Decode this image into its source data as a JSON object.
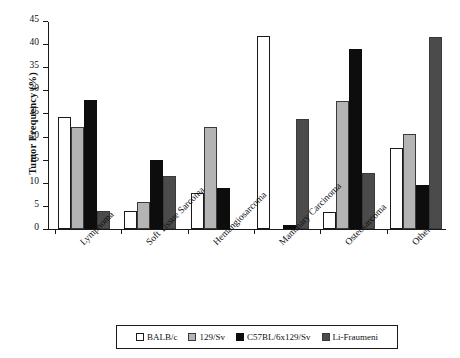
{
  "chart_data": {
    "type": "bar",
    "title": "",
    "xlabel": "",
    "ylabel": "Tumor Frequency (%)",
    "ylim": [
      0,
      45
    ],
    "yticks": [
      0,
      5,
      10,
      15,
      20,
      25,
      30,
      35,
      40,
      45
    ],
    "grid": false,
    "legend_position": "bottom",
    "categories": [
      "Lymphoma",
      "Soft Tissue Sarcoma",
      "Hemangiosarcoma",
      "Mammary Carcinoma",
      "Osteosarcoma",
      "Other"
    ],
    "series": [
      {
        "name": "BALB/c",
        "color": "#ffffff",
        "values": [
          24.3,
          3.8,
          7.8,
          41.8,
          3.6,
          17.5
        ]
      },
      {
        "name": "129/Sv",
        "color": "#b4b4b4",
        "values": [
          22.1,
          5.9,
          22.0,
          0,
          27.8,
          20.6
        ]
      },
      {
        "name": "C57BL/6x129/Sv",
        "color": "#0d0d0d",
        "values": [
          28.0,
          15.0,
          8.8,
          0.9,
          39.0,
          9.6
        ]
      },
      {
        "name": "Li-Fraumeni",
        "color": "#4b4b4b",
        "values": [
          4.0,
          11.4,
          0,
          23.9,
          12.2,
          41.6
        ]
      }
    ]
  },
  "legend": {
    "items": [
      {
        "label": "BALB/c"
      },
      {
        "label": "129/Sv"
      },
      {
        "label": "C57BL/6x129/Sv"
      },
      {
        "label": "Li-Fraumeni"
      }
    ]
  }
}
